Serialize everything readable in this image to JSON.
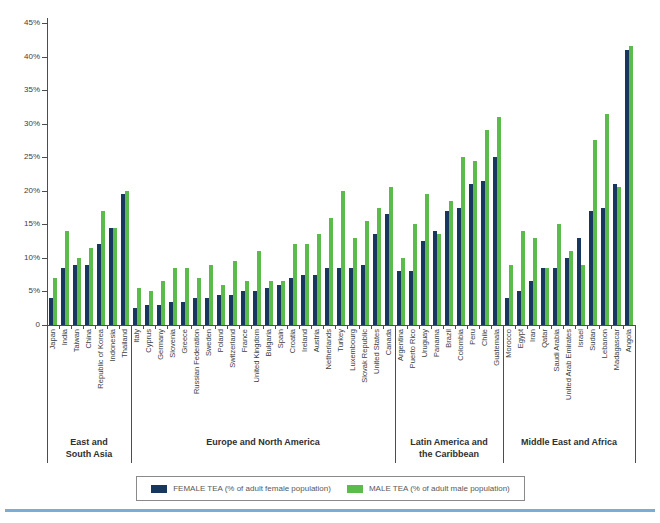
{
  "colors": {
    "female_bar": "#17375e",
    "male_bar": "#5cbc4b",
    "axis": "#4d4d4f",
    "bottom_rule": "#79add6"
  },
  "chart_data": {
    "type": "bar",
    "title": "",
    "xlabel": "",
    "ylabel": "",
    "ylim": [
      0,
      45
    ],
    "ytick_step": 5,
    "ytick_labels": [
      "45%",
      "40%",
      "35%",
      "30%",
      "25%",
      "20%",
      "15%",
      "10%",
      "5%",
      "0"
    ],
    "grid": false,
    "legend_position": "bottom",
    "series_meta": [
      {
        "key": "female",
        "name": "FEMALE TEA (% of adult female population)",
        "color": "#17375e"
      },
      {
        "key": "male",
        "name": "MALE TEA (% of adult male population)",
        "color": "#5cbc4b"
      }
    ],
    "regions": [
      {
        "label": "East and\nSouth Asia",
        "countries": [
          {
            "name": "Japan",
            "female": 4,
            "male": 7
          },
          {
            "name": "India",
            "female": 8.5,
            "male": 14
          },
          {
            "name": "Taiwan",
            "female": 9,
            "male": 10
          },
          {
            "name": "China",
            "female": 9,
            "male": 11.5
          },
          {
            "name": "Republic of Korea",
            "female": 12,
            "male": 17
          },
          {
            "name": "Indonesia",
            "female": 14.5,
            "male": 14.5
          },
          {
            "name": "Thailand",
            "female": 19.5,
            "male": 20
          }
        ]
      },
      {
        "label": "Europe and North America",
        "countries": [
          {
            "name": "Italy",
            "female": 2.5,
            "male": 5.5
          },
          {
            "name": "Cyprus",
            "female": 3,
            "male": 5
          },
          {
            "name": "Germany",
            "female": 3,
            "male": 6.5
          },
          {
            "name": "Slovenia",
            "female": 3.5,
            "male": 8.5
          },
          {
            "name": "Greece",
            "female": 3.5,
            "male": 8.5
          },
          {
            "name": "Russian Federation",
            "female": 4,
            "male": 7
          },
          {
            "name": "Sweden",
            "female": 4,
            "male": 9
          },
          {
            "name": "Poland",
            "female": 4.5,
            "male": 6
          },
          {
            "name": "Switzerland",
            "female": 4.5,
            "male": 9.5
          },
          {
            "name": "France",
            "female": 5,
            "male": 6.5
          },
          {
            "name": "United Kingdom",
            "female": 5,
            "male": 11
          },
          {
            "name": "Bulgaria",
            "female": 5.5,
            "male": 6.5
          },
          {
            "name": "Spain",
            "female": 6,
            "male": 6.5
          },
          {
            "name": "Croatia",
            "female": 7,
            "male": 12
          },
          {
            "name": "Ireland",
            "female": 7.5,
            "male": 12
          },
          {
            "name": "Austria",
            "female": 7.5,
            "male": 13.5
          },
          {
            "name": "Netherlands",
            "female": 8.5,
            "male": 16
          },
          {
            "name": "Turkey",
            "female": 8.5,
            "male": 20
          },
          {
            "name": "Luxembourg",
            "female": 8.5,
            "male": 13
          },
          {
            "name": "Slovak Republic",
            "female": 9,
            "male": 15.5
          },
          {
            "name": "United States",
            "female": 13.5,
            "male": 17.5
          },
          {
            "name": "Canada",
            "female": 16.5,
            "male": 20.5
          }
        ]
      },
      {
        "label": "Latin America and\nthe Caribbean",
        "countries": [
          {
            "name": "Argentina",
            "female": 8,
            "male": 10
          },
          {
            "name": "Puerto Rico",
            "female": 8,
            "male": 15
          },
          {
            "name": "Uruguay",
            "female": 12.5,
            "male": 19.5
          },
          {
            "name": "Panama",
            "female": 14,
            "male": 13.5
          },
          {
            "name": "Brazil",
            "female": 17,
            "male": 18.5
          },
          {
            "name": "Colombia",
            "female": 17.5,
            "male": 25
          },
          {
            "name": "Peru",
            "female": 21,
            "male": 24.5
          },
          {
            "name": "Chile",
            "female": 21.5,
            "male": 29
          },
          {
            "name": "Guatemala",
            "female": 25,
            "male": 31
          }
        ]
      },
      {
        "label": "Middle East and Africa",
        "countries": [
          {
            "name": "Morocco",
            "female": 4,
            "male": 9
          },
          {
            "name": "Egypt",
            "female": 5,
            "male": 14
          },
          {
            "name": "Iran",
            "female": 6.5,
            "male": 13
          },
          {
            "name": "Qatar",
            "female": 8.5,
            "male": 8.5
          },
          {
            "name": "Saudi Arabia",
            "female": 8.5,
            "male": 15
          },
          {
            "name": "United Arab Emirates",
            "female": 10,
            "male": 11
          },
          {
            "name": "Israel",
            "female": 13,
            "male": 9
          },
          {
            "name": "Sudan",
            "female": 17,
            "male": 27.5
          },
          {
            "name": "Lebanon",
            "female": 17.5,
            "male": 31.5
          },
          {
            "name": "Madagascar",
            "female": 21,
            "male": 20.5
          },
          {
            "name": "Angola",
            "female": 41,
            "male": 41.5
          }
        ]
      }
    ]
  }
}
